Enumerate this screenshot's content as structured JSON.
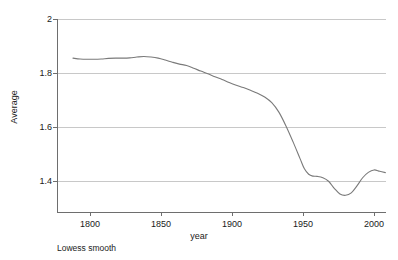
{
  "chart_data": {
    "type": "line",
    "title": "",
    "subtitle": "",
    "xlabel": "year",
    "ylabel": "Average",
    "annotation": "Lowess smooth",
    "grid": "horizontal",
    "legend": "none",
    "xlim": [
      1786,
      2010
    ],
    "ylim": [
      1.33,
      2.0
    ],
    "xticks": [
      1800,
      1850,
      1900,
      1950,
      2000
    ],
    "xtick_labels": [
      "1800",
      "1850",
      "1900",
      "1950",
      "2000"
    ],
    "yticks": [
      1.4,
      1.6,
      1.8,
      2.0
    ],
    "ytick_labels": [
      "1.4",
      "1.6",
      "1.8",
      "2"
    ],
    "series": [
      {
        "name": "Lowess smooth",
        "color": "#7a7a7a",
        "x": [
          1788,
          1793,
          1798,
          1803,
          1808,
          1813,
          1818,
          1823,
          1828,
          1833,
          1838,
          1843,
          1848,
          1853,
          1858,
          1863,
          1868,
          1873,
          1878,
          1883,
          1888,
          1893,
          1898,
          1903,
          1908,
          1913,
          1918,
          1923,
          1928,
          1933,
          1938,
          1943,
          1948,
          1951,
          1954,
          1957,
          1960,
          1964,
          1968,
          1972,
          1976,
          1980,
          1984,
          1988,
          1992,
          1996,
          2000,
          2004,
          2008
        ],
        "y": [
          1.855,
          1.852,
          1.851,
          1.851,
          1.852,
          1.854,
          1.855,
          1.855,
          1.856,
          1.859,
          1.861,
          1.859,
          1.855,
          1.848,
          1.84,
          1.833,
          1.828,
          1.818,
          1.807,
          1.797,
          1.786,
          1.776,
          1.765,
          1.755,
          1.746,
          1.736,
          1.725,
          1.711,
          1.69,
          1.655,
          1.604,
          1.545,
          1.482,
          1.445,
          1.425,
          1.418,
          1.417,
          1.412,
          1.399,
          1.373,
          1.352,
          1.347,
          1.356,
          1.382,
          1.412,
          1.432,
          1.441,
          1.436,
          1.431
        ]
      }
    ]
  },
  "axis": {
    "y_title": "Average",
    "x_title": "year"
  },
  "footnote": {
    "text": "Lowess smooth"
  },
  "colors": {
    "line": "#7a7a7a",
    "grid": "#c8c8c8",
    "axis": "#6e6e6e",
    "text": "#1a1a1a",
    "background": "#ffffff"
  }
}
